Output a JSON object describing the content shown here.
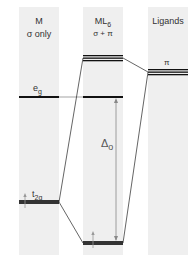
{
  "columns": [
    {
      "title": "M",
      "subtitle": "σ only"
    },
    {
      "title": "ML",
      "title_sub": "6",
      "subtitle": "σ + π"
    },
    {
      "title": "Ligands",
      "subtitle": ""
    }
  ],
  "levels": {
    "eg": {
      "main": "e",
      "sub": "g"
    },
    "t2g": {
      "main": "t",
      "sub": "2g"
    },
    "pi": "π",
    "delta": {
      "main": "Δ",
      "sub": "o"
    }
  },
  "colors": {
    "band": "#efefef",
    "line": "#111111",
    "arrow": "#888888"
  }
}
